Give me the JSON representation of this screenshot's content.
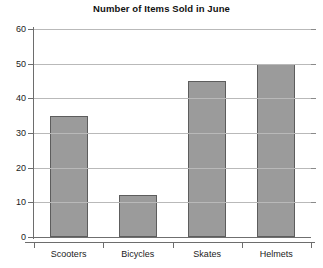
{
  "chart_data": {
    "type": "bar",
    "title": "Number of Items Sold in June",
    "xlabel": "",
    "ylabel": "",
    "categories": [
      "Scooters",
      "Bicycles",
      "Skates",
      "Helmets"
    ],
    "values": [
      35,
      12,
      45,
      50
    ],
    "series": [
      {
        "name": "Items Sold",
        "values": [
          35,
          12,
          45,
          50
        ]
      }
    ],
    "ylim": [
      0,
      60
    ],
    "ytick_labels": [
      "0",
      "10",
      "20",
      "30",
      "40",
      "50",
      "60"
    ],
    "ytick_values": [
      0,
      10,
      20,
      30,
      40,
      50,
      60
    ],
    "grid": true,
    "grid_axis": "y",
    "legend": false,
    "legend_position": "none",
    "bar_fill_color": "#9b9b9b",
    "bar_border_color": "#5d5d5d",
    "gridline_color": "#b9b9b9",
    "axis_color": "#6d6d6d",
    "background_color": "#ffffff"
  }
}
